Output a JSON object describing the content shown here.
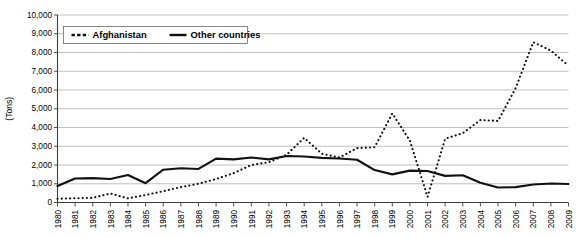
{
  "chart_data": {
    "type": "line",
    "title": "",
    "xlabel": "",
    "ylabel": "(Tons)",
    "ylim": [
      0,
      10000
    ],
    "ytick_labels": [
      "10,000",
      "9,000",
      "8,000",
      "7,000",
      "6,000",
      "5,000",
      "4,000",
      "3,000",
      "2,000",
      "1,000",
      "0"
    ],
    "ytick_values": [
      10000,
      9000,
      8000,
      7000,
      6000,
      5000,
      4000,
      3000,
      2000,
      1000,
      0
    ],
    "grid": true,
    "legend_position": "top-left",
    "categories": [
      "1980",
      "1981",
      "1982",
      "1983",
      "1984",
      "1985",
      "1986",
      "1987",
      "1988",
      "1989",
      "1990",
      "1991",
      "1992",
      "1993",
      "1994",
      "1995",
      "1996",
      "1997",
      "1998",
      "1999",
      "2000",
      "2001",
      "2002",
      "2003",
      "2004",
      "2005",
      "2006",
      "2007",
      "2008",
      "2009"
    ],
    "series": [
      {
        "name": "Afghanistan",
        "style": "dotted",
        "values": [
          200,
          225,
          250,
          480,
          220,
          400,
          600,
          820,
          1000,
          1250,
          1570,
          2000,
          2150,
          2550,
          3450,
          2600,
          2400,
          2900,
          2950,
          4750,
          3300,
          300,
          3400,
          3700,
          4400,
          4350,
          6100,
          8550,
          8100,
          7300
        ]
      },
      {
        "name": "Other countries",
        "style": "solid",
        "values": [
          880,
          1280,
          1300,
          1250,
          1470,
          1030,
          1750,
          1830,
          1790,
          2340,
          2300,
          2400,
          2300,
          2480,
          2450,
          2380,
          2350,
          2280,
          1730,
          1500,
          1700,
          1680,
          1420,
          1450,
          1050,
          800,
          820,
          960,
          1010,
          990
        ]
      }
    ]
  },
  "legend": {
    "items": [
      {
        "label": "Afghanistan",
        "style": "dotted"
      },
      {
        "label": "Other countries",
        "style": "solid"
      }
    ]
  }
}
